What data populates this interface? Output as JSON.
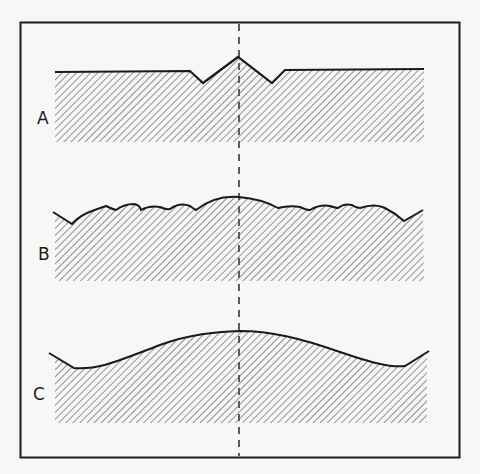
{
  "figure": {
    "panels": [
      {
        "id": "A",
        "label": "A",
        "description": "Flat surface with a single central peak flanked by two V-shaped notches"
      },
      {
        "id": "B",
        "label": "B",
        "description": "Gently domed surface with many small superimposed undulations"
      },
      {
        "id": "C",
        "label": "C",
        "description": "Smooth broad domed surface"
      }
    ],
    "center_line": "dashed vertical axis through center of all profiles"
  },
  "colors": {
    "background": "#f7f7f5",
    "line": "#1a1a1a",
    "hatch": "#555555"
  }
}
